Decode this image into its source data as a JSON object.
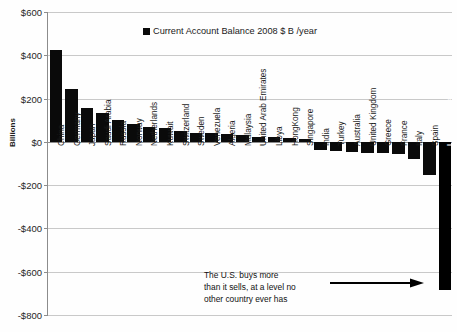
{
  "chart_data": {
    "type": "bar",
    "title": "",
    "xlabel": "",
    "ylabel": "Billions",
    "ylim": [
      -800,
      600
    ],
    "grid": true,
    "legend_position": "top-center",
    "legend": [
      "Current Account Balance 2008 $ B /year"
    ],
    "ytick_labels": [
      "$600",
      "$400",
      "$200",
      "$0",
      "-$200",
      "-$400",
      "-$600",
      "-$800"
    ],
    "ytick_values": [
      600,
      400,
      200,
      0,
      -200,
      -400,
      -600,
      -800
    ],
    "categories": [
      "China",
      "Germany",
      "Japan",
      "Saudi Arabia",
      "Russia",
      "Norway",
      "Netherlands",
      "Kuwait",
      "Switzerland",
      "Sweden",
      "Venezuela",
      "Algeria",
      "Malaysia",
      "United Arab Emirates",
      "Libya",
      "HongKong",
      "Singapore",
      "India",
      "Turkey",
      "Australia",
      "United Kingdom",
      "Greece",
      "France",
      "Italy",
      "Spain",
      "United States"
    ],
    "values": [
      426,
      243,
      157,
      132,
      102,
      82,
      67,
      65,
      48,
      42,
      39,
      34,
      30,
      23,
      21,
      18,
      15,
      -37,
      -41,
      -47,
      -50,
      -51,
      -56,
      -78,
      -154,
      -685
    ],
    "annotations": [
      {
        "text": "The U.S. buys more than it sells, at a level no other country ever has",
        "target": "United States",
        "arrow": "right"
      }
    ]
  },
  "legend": {
    "label": "Current Account Balance 2008 $ B /year"
  },
  "axes": {
    "y_title": "Billions"
  },
  "annotation": {
    "line1": "The U.S. buys more",
    "line2": "than it sells, at a level no",
    "line3": "other country ever has"
  }
}
